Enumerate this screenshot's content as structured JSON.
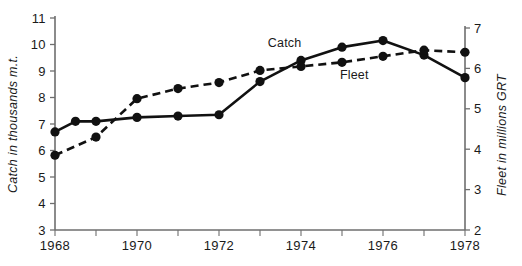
{
  "chart_data": {
    "type": "line",
    "title": "",
    "xlabel": "",
    "ylabel": "Catch in thousands m.t.",
    "y2label": "Fleet in millions GRT",
    "grid": false,
    "legend_position": "inline-annotation",
    "x": [
      1968,
      1969,
      1970,
      1971,
      1972,
      1973,
      1974,
      1975,
      1976,
      1977,
      1978
    ],
    "xlim": [
      1968,
      1978
    ],
    "xticks": [
      1968,
      1969,
      1970,
      1971,
      1972,
      1973,
      1974,
      1975,
      1976,
      1977,
      1978
    ],
    "xtick_labels": [
      "1968",
      "",
      "1970",
      "",
      "1972",
      "",
      "1974",
      "",
      "1976",
      "",
      "1978"
    ],
    "ylim": [
      3,
      11
    ],
    "yticks": [
      3,
      4,
      5,
      6,
      7,
      8,
      9,
      10,
      11
    ],
    "ytick_labels": [
      "3",
      "4",
      "5",
      "6",
      "7",
      "8",
      "9",
      "10",
      "11"
    ],
    "y2lim": [
      2,
      7
    ],
    "y2ticks": [
      2,
      3,
      4,
      5,
      6,
      7
    ],
    "y2tick_labels": [
      "2",
      "3",
      "4",
      "5",
      "6",
      "7"
    ],
    "series": [
      {
        "name": "Catch",
        "axis": "left",
        "style": "solid",
        "marker": "filled-circle",
        "color": "#111111",
        "label_x": 1973.6,
        "label_y": 9.9,
        "x": [
          1968,
          1968.5,
          1969,
          1970,
          1971,
          1972,
          1973,
          1974,
          1975,
          1976,
          1977,
          1978
        ],
        "values": [
          6.7,
          7.1,
          7.1,
          7.25,
          7.3,
          7.35,
          8.6,
          9.4,
          9.9,
          10.15,
          9.6,
          8.75
        ]
      },
      {
        "name": "Fleet",
        "axis": "right",
        "style": "dashed",
        "marker": "filled-circle",
        "color": "#111111",
        "label_x": 1975.3,
        "label_y": 5.75,
        "x": [
          1968,
          1969,
          1970,
          1971,
          1972,
          1973,
          1974,
          1975,
          1976,
          1977,
          1978
        ],
        "values": [
          3.85,
          4.3,
          5.25,
          5.5,
          5.65,
          5.95,
          6.05,
          6.15,
          6.3,
          6.45,
          6.4
        ]
      }
    ]
  },
  "labels": {
    "y_axis_title": "Catch in thousands m.t.",
    "y2_axis_title": "Fleet in millions GRT",
    "series_catch": "Catch",
    "series_fleet": "Fleet"
  }
}
